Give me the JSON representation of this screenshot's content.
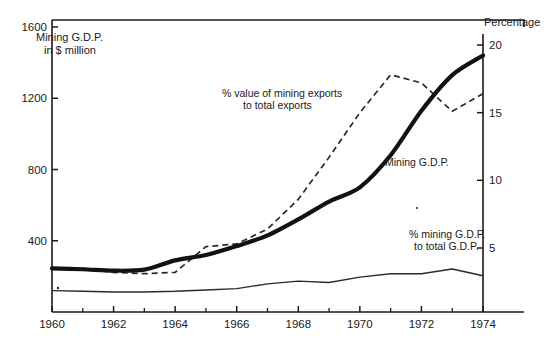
{
  "chart_data": {
    "type": "line",
    "title": "",
    "subtitle": "",
    "xlabel": "",
    "ylabel": "Mining G.D.P. in $ million",
    "y2label": "Percentage",
    "xlim": [
      1960,
      1974
    ],
    "ylim": [
      0,
      1600
    ],
    "y2lim": [
      0,
      20
    ],
    "grid": false,
    "legend": "annotations-inline",
    "x": [
      1960,
      1961,
      1962,
      1963,
      1964,
      1965,
      1966,
      1967,
      1968,
      1969,
      1970,
      1971,
      1972,
      1973,
      1974
    ],
    "series": [
      {
        "name": "Mining G.D.P.",
        "axis": "left",
        "units": "$ million",
        "style": "solid-thick",
        "values": [
          245,
          240,
          232,
          238,
          290,
          320,
          370,
          430,
          520,
          620,
          700,
          880,
          1130,
          1330,
          1440
        ]
      },
      {
        "name": "% value of mining exports to total exports",
        "axis": "right",
        "units": "percent",
        "style": "dashed",
        "values": [
          3.5,
          3.5,
          3.2,
          3.1,
          3.2,
          5.1,
          5.3,
          6.4,
          8.6,
          11.7,
          15.0,
          17.8,
          17.2,
          15.1,
          16.4
        ]
      },
      {
        "name": "% mining G.D.P. to total G.D.P.",
        "axis": "right",
        "units": "percent",
        "style": "solid-thin",
        "values": [
          1.85,
          1.8,
          1.75,
          1.75,
          1.8,
          1.9,
          2.0,
          2.35,
          2.55,
          2.45,
          2.85,
          3.1,
          3.1,
          3.45,
          2.95
        ]
      }
    ],
    "x_ticks": [
      {
        "value": 1960,
        "label": "1960",
        "major": true
      },
      {
        "value": 1961,
        "label": "",
        "major": false
      },
      {
        "value": 1962,
        "label": "1962",
        "major": true
      },
      {
        "value": 1963,
        "label": "",
        "major": false
      },
      {
        "value": 1964,
        "label": "1964",
        "major": true
      },
      {
        "value": 1965,
        "label": "",
        "major": false
      },
      {
        "value": 1966,
        "label": "1966",
        "major": true
      },
      {
        "value": 1967,
        "label": "",
        "major": false
      },
      {
        "value": 1968,
        "label": "1968",
        "major": true
      },
      {
        "value": 1969,
        "label": "",
        "major": false
      },
      {
        "value": 1970,
        "label": "1970",
        "major": true
      },
      {
        "value": 1971,
        "label": "",
        "major": false
      },
      {
        "value": 1972,
        "label": "1972",
        "major": true
      },
      {
        "value": 1973,
        "label": "",
        "major": false
      },
      {
        "value": 1974,
        "label": "1974",
        "major": true
      }
    ],
    "y_left_ticks": [
      {
        "value": 1600,
        "label": "1600"
      },
      {
        "value": 1200,
        "label": "1200"
      },
      {
        "value": 800,
        "label": "800"
      },
      {
        "value": 400,
        "label": "400"
      }
    ],
    "y_right_ticks": [
      {
        "value": 20,
        "label": "20"
      },
      {
        "value": 15,
        "label": "15"
      },
      {
        "value": 10,
        "label": "10"
      },
      {
        "value": 5,
        "label": "5"
      }
    ],
    "annotations": [
      {
        "id": "exports-annotation",
        "line1": "% value of mining exports",
        "line2": "to total exports"
      },
      {
        "id": "gdp-annotation",
        "line1": "Mining G.D.P.",
        "line2": ""
      },
      {
        "id": "share-annotation",
        "line1": "% mining G.D.P.",
        "line2": "to total G.D.P."
      }
    ],
    "colors": {
      "ink": "#1a1a1a",
      "background": "#ffffff"
    }
  },
  "axes": {
    "left_title_line1": "Mining G.D.P.",
    "left_title_line2": "in $ million",
    "right_title": "Percentage"
  }
}
